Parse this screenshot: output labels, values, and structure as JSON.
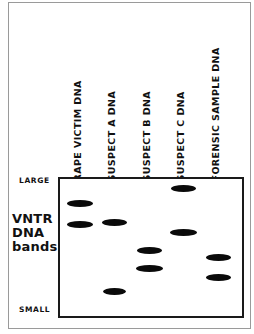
{
  "figure": {
    "ink_color": "#0a0a0a",
    "background_color": "#ffffff"
  },
  "axis": {
    "top_label": "LARGE",
    "bottom_label": "SMALL",
    "title_line1": "VNTR",
    "title_line2": "DNA",
    "title_line3": "bands"
  },
  "chart_data": {
    "type": "scatter",
    "title": "VNTR DNA bands",
    "xlabel": "",
    "ylabel": "VNTR DNA bands",
    "grid": false,
    "legend": "none",
    "y_axis": {
      "top_tick_label": "LARGE",
      "bottom_tick_label": "SMALL",
      "direction": "large fragments at top, small fragments at bottom",
      "range_pixels": [
        177,
        318
      ]
    },
    "categories": [
      "RAPE VICTIM DNA",
      "SUSPECT A DNA",
      "SUSPECT B DNA",
      "SUSPECT C DNA",
      "FORENSIC SAMPLE DNA"
    ],
    "lanes": [
      {
        "index": 1,
        "label": "RAPE VICTIM DNA",
        "lane_center_x": 80,
        "band_count": 2,
        "bands": [
          {
            "y": 203,
            "width": 26,
            "size_fraction": 0.18
          },
          {
            "y": 224,
            "width": 26,
            "size_fraction": 0.33
          }
        ]
      },
      {
        "index": 2,
        "label": "SUSPECT A DNA",
        "lane_center_x": 114,
        "band_count": 2,
        "bands": [
          {
            "y": 222,
            "width": 25,
            "size_fraction": 0.32
          },
          {
            "y": 291,
            "width": 23,
            "size_fraction": 0.81
          }
        ]
      },
      {
        "index": 3,
        "label": "SUSPECT B DNA",
        "lane_center_x": 149,
        "band_count": 2,
        "bands": [
          {
            "y": 250,
            "width": 25,
            "size_fraction": 0.52
          },
          {
            "y": 268,
            "width": 27,
            "size_fraction": 0.65
          }
        ]
      },
      {
        "index": 4,
        "label": "SUSPECT C DNA",
        "lane_center_x": 183,
        "band_count": 2,
        "bands": [
          {
            "y": 188,
            "width": 25,
            "size_fraction": 0.08
          },
          {
            "y": 232,
            "width": 27,
            "size_fraction": 0.39
          }
        ]
      },
      {
        "index": 5,
        "label": "FORENSIC SAMPLE DNA",
        "lane_center_x": 218,
        "band_count": 2,
        "bands": [
          {
            "y": 257,
            "width": 25,
            "size_fraction": 0.57
          },
          {
            "y": 277,
            "width": 25,
            "size_fraction": 0.71
          }
        ]
      }
    ]
  },
  "columns": [
    {
      "label": "RAPE VICTIM DNA",
      "left": 82,
      "bottom": 172
    },
    {
      "label": "SUSPECT A DNA",
      "left": 116,
      "bottom": 172
    },
    {
      "label": "SUSPECT B DNA",
      "left": 151,
      "bottom": 172
    },
    {
      "label": "SUSPECT C DNA",
      "left": 185,
      "bottom": 172
    },
    {
      "label": "FORENSIC SAMPLE DNA",
      "left": 220,
      "bottom": 172
    }
  ]
}
